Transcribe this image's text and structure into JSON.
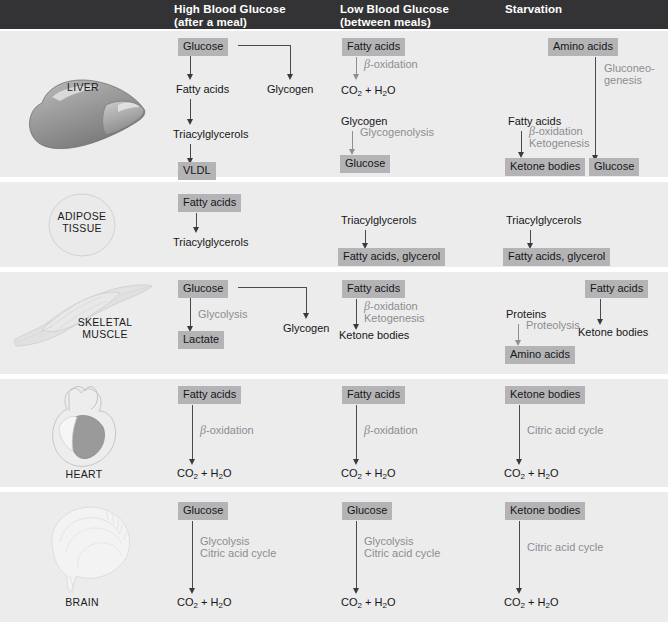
{
  "header": {
    "columns": [
      {
        "name": "high-blood-glucose",
        "line1": "High Blood Glucose",
        "line2": "(after a meal)"
      },
      {
        "name": "low-blood-glucose",
        "line1": "Low Blood Glucose",
        "line2": "(between meals)"
      },
      {
        "name": "starvation",
        "line1": "Starvation",
        "line2": ""
      }
    ]
  },
  "tissues": {
    "liver": "LIVER",
    "adipose": "ADIPOSE\nTISSUE",
    "muscle": "SKELETAL\nMUSCLE",
    "heart": "HEART",
    "brain": "BRAIN"
  },
  "labels": {
    "glucose": "Glucose",
    "fatty_acids": "Fatty acids",
    "glycogen": "Glycogen",
    "triacylglycerols": "Triacylglycerols",
    "vldl": "VLDL",
    "amino_acids": "Amino acids",
    "ketone_bodies": "Ketone bodies",
    "lactate": "Lactate",
    "proteins": "Proteins",
    "fatty_acids_glycerol": "Fatty acids, glycerol"
  },
  "enzymes": {
    "beta_oxidation": "-oxidation",
    "beta": "β",
    "glycogenolysis": "Glycogenolysis",
    "gluconeogenesis_l1": "Gluconeo-",
    "gluconeogenesis_l2": "genesis",
    "ketogenesis": "Ketogenesis",
    "glycolysis": "Glycolysis",
    "citric_acid_cycle": "Citric acid cycle",
    "proteolysis": "Proteolysis"
  },
  "formulas": {
    "co2_h2o_pre": "CO",
    "co2_sub": "2",
    "co2_h2o_mid": " + H",
    "h2o_sub": "2",
    "h2o_post": "O"
  },
  "colors": {
    "header_bar": "#333335",
    "row_background": "#ececed",
    "node_box": "#b4b4b6",
    "arrow": "#4a4a4c",
    "enzyme_text": "#8d8d90",
    "page_background": "#ffffff"
  }
}
